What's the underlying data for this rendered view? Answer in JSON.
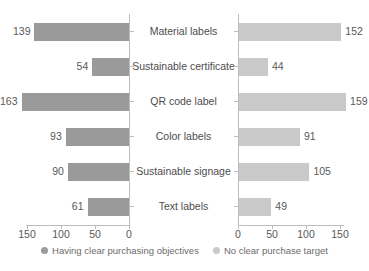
{
  "chart_data": {
    "type": "bar",
    "subtype": "diverging-butterfly-bar",
    "title": "",
    "xlabel": "",
    "ylabel": "",
    "grid": false,
    "legend_position": "bottom-center",
    "categories": [
      "Material labels",
      "Sustainable certificate",
      "QR code label",
      "Color labels",
      "Sustainable signage",
      "Text labels"
    ],
    "series": [
      {
        "name": "Having clear purchasing objectives",
        "side": "left",
        "color": "#9a9a9a",
        "axis_direction": "reversed",
        "xlim": [
          0,
          175
        ],
        "ticks": [
          150,
          100,
          50,
          0
        ],
        "values": [
          139,
          54,
          163,
          93,
          90,
          61
        ]
      },
      {
        "name": "No clear purchase target",
        "side": "right",
        "color": "#c9c9c9",
        "axis_direction": "normal",
        "xlim": [
          0,
          175
        ],
        "ticks": [
          0,
          50,
          100,
          150
        ],
        "values": [
          152,
          44,
          159,
          91,
          105,
          49
        ]
      }
    ]
  },
  "axes": {
    "left_ticks": [
      "150",
      "100",
      "50",
      "0"
    ],
    "right_ticks": [
      "0",
      "50",
      "100",
      "150"
    ]
  },
  "legend": {
    "items": [
      {
        "label": "Having clear purchasing objectives",
        "color": "#9a9a9a"
      },
      {
        "label": "No clear purchase target",
        "color": "#c9c9c9"
      }
    ]
  }
}
